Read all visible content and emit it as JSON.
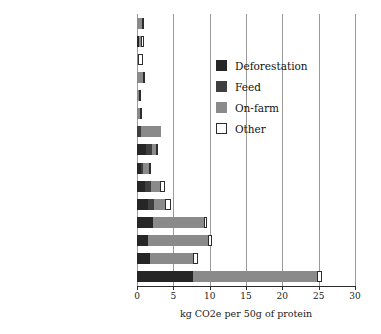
{
  "chart_data": {
    "type": "bar",
    "orientation": "horizontal",
    "stacked": true,
    "title": "",
    "xlabel": "kg CO2e per 50g of protein",
    "ylabel": "",
    "xlim": [
      0,
      30
    ],
    "xticks": [
      0,
      5,
      10,
      15,
      20,
      25,
      30
    ],
    "xticklabels": [
      "0",
      "5",
      "10",
      "15",
      "20",
      "25",
      "30"
    ],
    "grid": "vertical",
    "legend_position": "upper right",
    "series": [
      {
        "name": "Deforestation",
        "color": "#262626",
        "values": [
          0.0,
          0.3,
          0.0,
          0.0,
          0.0,
          0.0,
          0.0,
          1.2,
          0.5,
          1.1,
          1.5,
          2.2,
          1.5,
          1.8,
          7.7
        ]
      },
      {
        "name": "Feed",
        "color": "#3f3f3f",
        "values": [
          0.0,
          0.0,
          0.0,
          0.0,
          0.0,
          0.0,
          0.6,
          0.8,
          0.3,
          0.8,
          0.9,
          0.0,
          0.0,
          0.0,
          0.0
        ]
      },
      {
        "name": "On-farm",
        "color": "#8a8a8a",
        "values": [
          0.75,
          0.3,
          0.1,
          0.85,
          0.25,
          0.35,
          2.7,
          0.6,
          0.9,
          1.2,
          1.5,
          7.0,
          8.3,
          5.9,
          17.1
        ]
      },
      {
        "name": "Other",
        "color": "#ffffff",
        "values": [
          0.05,
          0.4,
          0.7,
          0.05,
          0.05,
          0.05,
          0.0,
          0.1,
          0.1,
          0.7,
          0.8,
          0.4,
          0.5,
          0.7,
          0.7
        ]
      }
    ],
    "categories": [
      "Pulses",
      "Tofu",
      "Soya milk",
      "Groundnuts",
      "Nuts",
      "Peas",
      "Fish (farmed)",
      "Eggs",
      "Milk",
      "Chicken",
      "Pork",
      "Lobsters, king prawns",
      "Lamb and mutton",
      "Beef (from a dairy herd)",
      "Beef (from a beef herd)"
    ],
    "totals": [
      0.8,
      1.0,
      0.8,
      0.9,
      0.3,
      0.4,
      3.3,
      2.7,
      1.8,
      3.8,
      4.7,
      9.6,
      10.3,
      8.4,
      25.5
    ]
  },
  "legend": {
    "items": [
      {
        "label": "Deforestation",
        "key": "deforestation"
      },
      {
        "label": "Feed",
        "key": "feed"
      },
      {
        "label": "On-farm",
        "key": "onfarm"
      },
      {
        "label": "Other",
        "key": "other"
      }
    ]
  }
}
